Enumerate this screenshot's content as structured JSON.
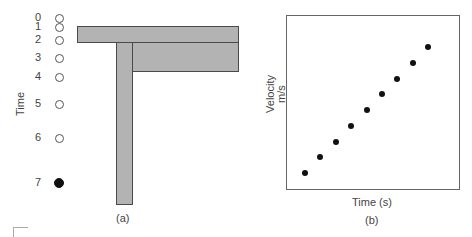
{
  "panel_a": {
    "axis_label": "Time",
    "caption": "(a)",
    "time_marks": [
      {
        "label": "0",
        "y": 18,
        "filled": false
      },
      {
        "label": "1",
        "y": 27,
        "filled": false
      },
      {
        "label": "2",
        "y": 40,
        "filled": false
      },
      {
        "label": "3",
        "y": 58,
        "filled": false
      },
      {
        "label": "4",
        "y": 77,
        "filled": false
      },
      {
        "label": "5",
        "y": 104,
        "filled": false
      },
      {
        "label": "6",
        "y": 138,
        "filled": false
      },
      {
        "label": "7",
        "y": 183,
        "filled": true
      }
    ],
    "bar_color": "#b3b3b3"
  },
  "panel_b": {
    "ylabel_line1": "Velocity",
    "ylabel_line2": "m/s",
    "xlabel": "Time (s)",
    "caption": "(b)"
  },
  "chart_data": {
    "type": "scatter",
    "title": "",
    "xlabel": "Time (s)",
    "ylabel": "Velocity m/s",
    "grid": false,
    "x": [
      0,
      1,
      2,
      3,
      4,
      5,
      6,
      7,
      8
    ],
    "values": [
      1,
      2,
      3,
      4,
      5,
      6,
      7,
      8,
      9
    ],
    "note": "Nine equally spaced points on a straight increasing line (constant acceleration); axes unlabeled numerically"
  }
}
